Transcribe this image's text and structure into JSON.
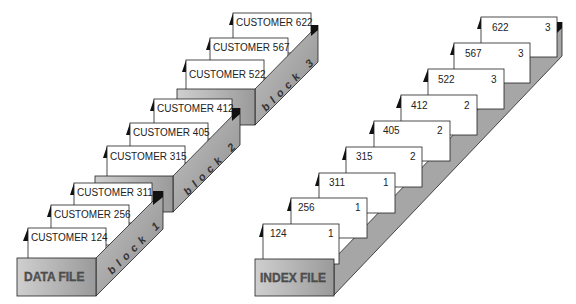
{
  "data_file": {
    "label": "DATA FILE",
    "blocks": [
      {
        "label": "block 1",
        "records": [
          "CUSTOMER 124",
          "CUSTOMER 256",
          "CUSTOMER 311"
        ]
      },
      {
        "label": "block 2",
        "records": [
          "CUSTOMER 315",
          "CUSTOMER 405",
          "CUSTOMER 412"
        ]
      },
      {
        "label": "block 3",
        "records": [
          "CUSTOMER 522",
          "CUSTOMER 567",
          "CUSTOMER 622"
        ]
      }
    ]
  },
  "index_file": {
    "label": "INDEX FILE",
    "entries": [
      {
        "key": "124",
        "block": "1"
      },
      {
        "key": "256",
        "block": "1"
      },
      {
        "key": "311",
        "block": "1"
      },
      {
        "key": "315",
        "block": "2"
      },
      {
        "key": "405",
        "block": "2"
      },
      {
        "key": "412",
        "block": "2"
      },
      {
        "key": "522",
        "block": "3"
      },
      {
        "key": "567",
        "block": "3"
      },
      {
        "key": "622",
        "block": "3"
      }
    ]
  },
  "colors": {
    "box_front": "#b8b8b8",
    "box_side": "#a0a0a0",
    "outline": "#222222"
  }
}
